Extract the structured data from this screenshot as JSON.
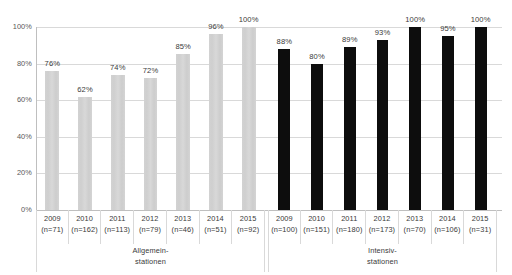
{
  "chart_data": {
    "type": "bar",
    "title": "",
    "subtitle": "",
    "xlabel": "",
    "ylabel": "",
    "ylim": [
      0,
      100
    ],
    "ytick_labels": [
      "100%",
      "80%",
      "60%",
      "40%",
      "20%",
      "0%"
    ],
    "ytick_values": [
      100,
      80,
      60,
      40,
      20,
      0
    ],
    "grid": true,
    "legend": "none",
    "groups": [
      {
        "name": "Allgemein-\nstationen",
        "caption_line1": "Allgemein-",
        "caption_line2": "stationen",
        "color": "#d4d4d4",
        "categories": [
          "2009",
          "2010",
          "2011",
          "2012",
          "2013",
          "2014",
          "2015"
        ],
        "n_labels": [
          "(n=71)",
          "(n=162)",
          "(n=113)",
          "(n=79)",
          "(n=46)",
          "(n=51)",
          "(n=92)"
        ],
        "n_values": [
          71,
          162,
          113,
          79,
          46,
          51,
          92
        ],
        "values": [
          76,
          62,
          74,
          72,
          85,
          96,
          100
        ],
        "value_labels": [
          "76%",
          "62%",
          "74%",
          "72%",
          "85%",
          "96%",
          "100%"
        ]
      },
      {
        "name": "Intensiv-\nstationen",
        "caption_line1": "Intensiv-",
        "caption_line2": "stationen",
        "color": "#0d0d0d",
        "categories": [
          "2009",
          "2010",
          "2011",
          "2012",
          "2013",
          "2014",
          "2015"
        ],
        "n_labels": [
          "(n=100)",
          "(n=151)",
          "(n=180)",
          "(n=173)",
          "(n=70)",
          "(n=106)",
          "(n=31)"
        ],
        "n_values": [
          100,
          151,
          180,
          173,
          70,
          106,
          31
        ],
        "values": [
          88,
          80,
          89,
          93,
          100,
          95,
          100
        ],
        "value_labels": [
          "88%",
          "80%",
          "89%",
          "93%",
          "100%",
          "95%",
          "100%"
        ]
      }
    ]
  },
  "colors": {
    "light_bar": "#d4d4d4",
    "dark_bar": "#0d0d0d",
    "gridline": "#d9d9d9",
    "axis": "#bfbfbf",
    "text": "#3a3a3a",
    "tick_text": "#595959",
    "background": "#ffffff"
  }
}
